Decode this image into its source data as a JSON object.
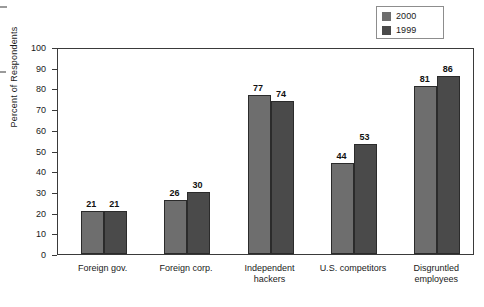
{
  "chart_data": {
    "type": "bar",
    "title": "",
    "subtitle": "",
    "xlabel": "",
    "ylabel": "Percent of Respondents",
    "ylim": [
      0,
      100
    ],
    "yticks": [
      0,
      10,
      20,
      30,
      40,
      50,
      60,
      70,
      80,
      90,
      100
    ],
    "ytick_labels": [
      "0",
      "10",
      "20",
      "30",
      "40",
      "50",
      "60",
      "70",
      "80",
      "90",
      "100"
    ],
    "grid": false,
    "legend_position": "top-right",
    "categories": [
      "Foreign gov.",
      "Foreign corp.",
      "Independent hackers",
      "U.S. competitors",
      "Disgruntled employees"
    ],
    "category_lines": [
      [
        "Foreign gov."
      ],
      [
        "Foreign corp."
      ],
      [
        "Independent",
        "hackers"
      ],
      [
        "U.S. competitors"
      ],
      [
        "Disgruntled",
        "employees"
      ]
    ],
    "series": [
      {
        "name": "2000",
        "color": "#6e6e6e",
        "values": [
          21,
          26,
          77,
          44,
          81
        ],
        "value_labels": [
          "21",
          "26",
          "77",
          "44",
          "81"
        ]
      },
      {
        "name": "1999",
        "color": "#4a4a4a",
        "values": [
          21,
          30,
          74,
          53,
          86
        ],
        "value_labels": [
          "21",
          "30",
          "74",
          "53",
          "86"
        ]
      }
    ]
  },
  "legend": {
    "entries": [
      {
        "label": "2000",
        "swatch_color": "#6e6e6e"
      },
      {
        "label": "1999",
        "swatch_color": "#4a4a4a"
      }
    ]
  },
  "axes": {
    "y_title": "Percent of Respondents",
    "axis_color": "#3a3a3a"
  }
}
